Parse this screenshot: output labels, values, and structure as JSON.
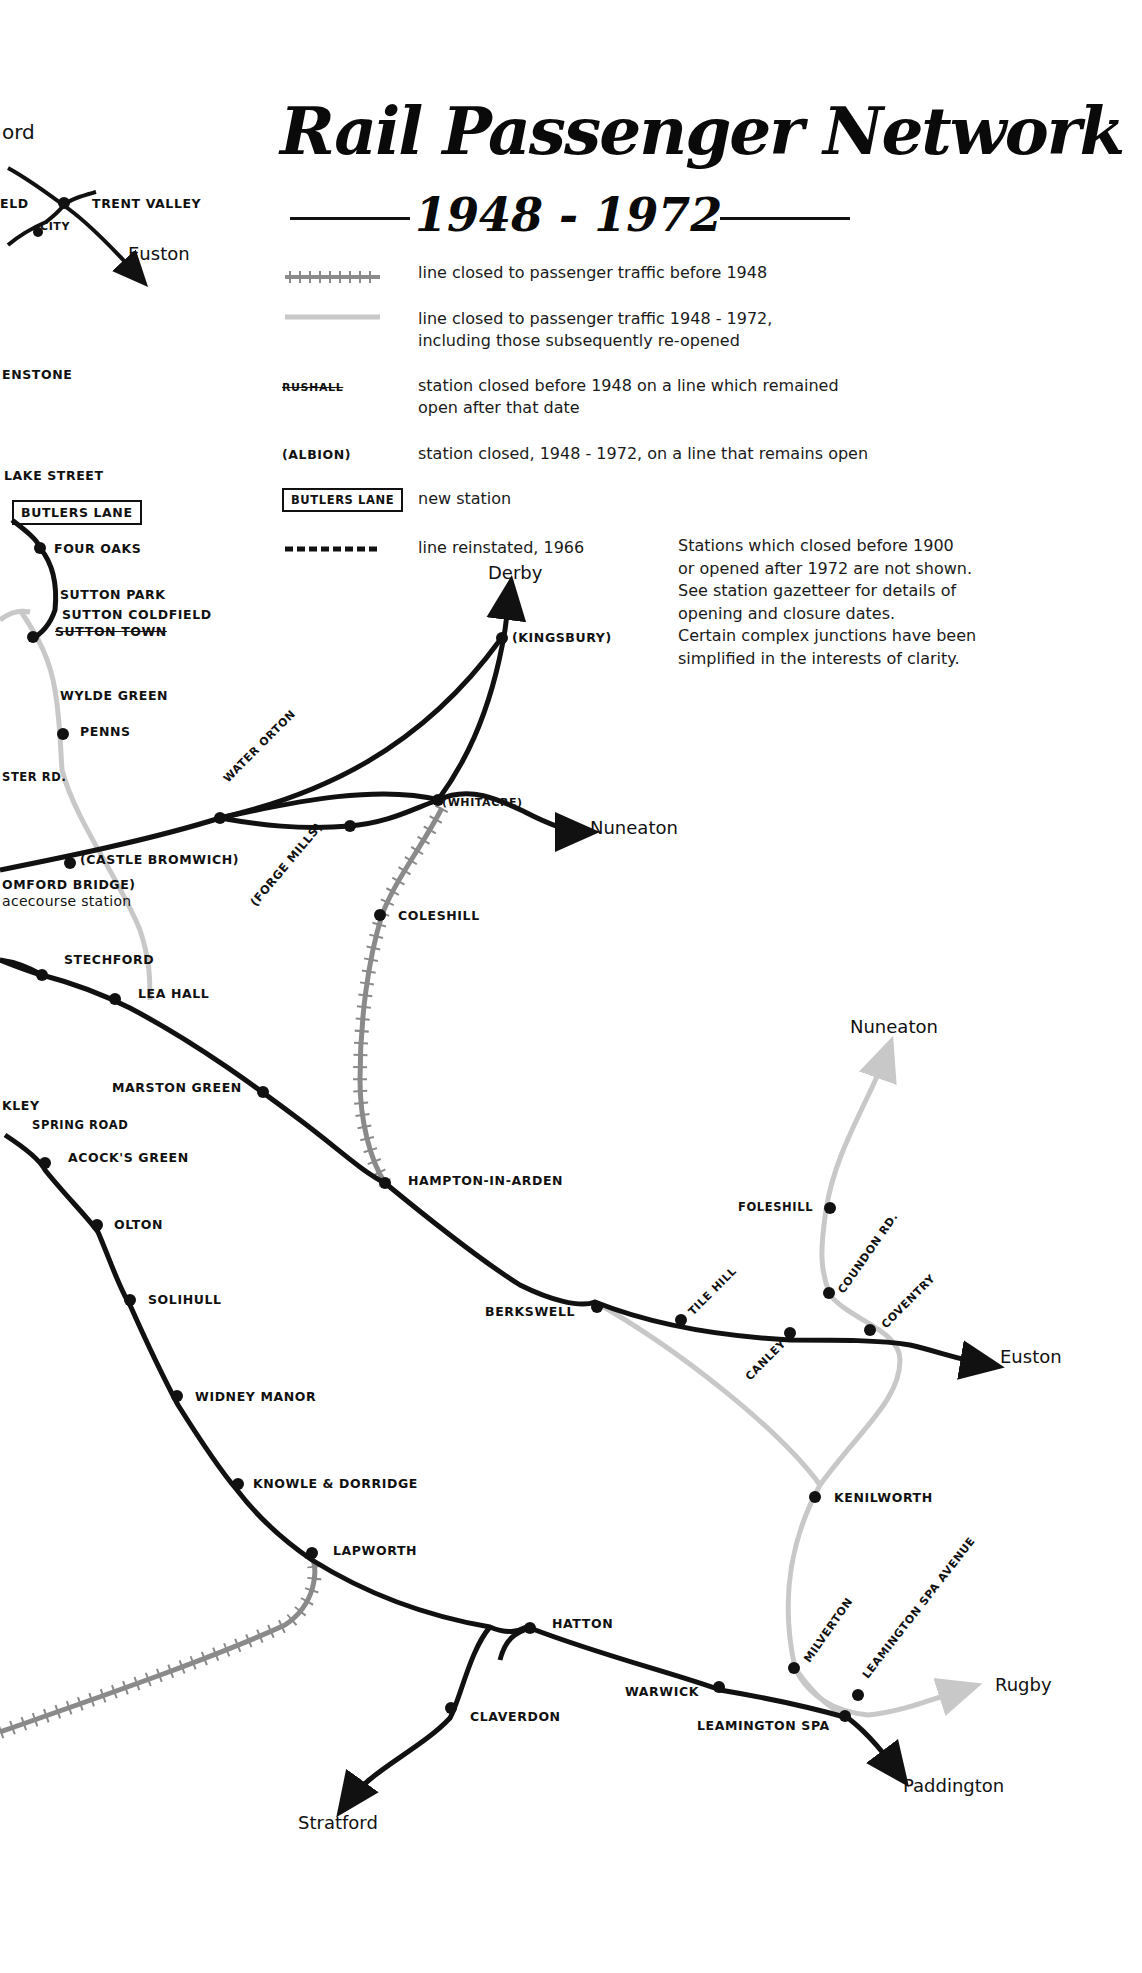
{
  "title": {
    "main": "Rail Passenger Network",
    "years": "1948 - 1972"
  },
  "legend": [
    {
      "symbol": "hatched-grey-line",
      "text": "line closed to passenger traffic before 1948"
    },
    {
      "symbol": "light-grey-line",
      "text": "line closed to passenger traffic 1948 - 1972,",
      "text2": "including those subsequently re-opened"
    },
    {
      "symbol": "struck-station",
      "sample": "RUSHALL",
      "text": "station closed before 1948 on a line which remained",
      "text2": "open after that date"
    },
    {
      "symbol": "bracketed-station",
      "sample": "(ALBION)",
      "text": "station closed, 1948 - 1972, on a line that remains open"
    },
    {
      "symbol": "boxed-station",
      "sample": "BUTLERS LANE",
      "text": "new station"
    },
    {
      "symbol": "dashed-line",
      "text": "line reinstated, 1966"
    }
  ],
  "notes": [
    "Stations which closed before 1900",
    "or opened after 1972 are not shown.",
    "See station gazetteer for details of",
    "opening and closure dates.",
    "Certain complex junctions have been",
    "simplified in the interests of clarity."
  ],
  "destinations": {
    "ord": "ord",
    "euston_top": "Euston",
    "derby": "Derby",
    "nuneaton_mid": "Nuneaton",
    "nuneaton_right": "Nuneaton",
    "euston_right": "Euston",
    "rugby": "Rugby",
    "paddington": "Paddington",
    "stratford": "Stratford"
  },
  "stations": {
    "eld": "ELD",
    "trent_valley": "TRENT VALLEY",
    "city": "CITY",
    "enstone": "ENSTONE",
    "lake_street": "LAKE STREET",
    "butlers_lane": "BUTLERS LANE",
    "four_oaks": "FOUR OAKS",
    "sutton_park": "SUTTON PARK",
    "sutton_coldfield": "SUTTON COLDFIELD",
    "sutton_town": "SUTTON TOWN",
    "wylde_green": "WYLDE GREEN",
    "penns": "PENNS",
    "ster_rd": "STER RD.",
    "water_orton": "WATER ORTON",
    "castle_bromwich": "(CASTLE BROMWICH)",
    "omford_bridge": "OMFORD BRIDGE)",
    "racecourse": "acecourse station",
    "forge_mills": "(FORGE MILLS)",
    "whitacre": "(WHITACRE)",
    "kingsbury": "(KINGSBURY)",
    "coleshill": "COLESHILL",
    "stechford": "STECHFORD",
    "lea_hall": "LEA HALL",
    "marston_green": "MARSTON GREEN",
    "kley": "KLEY",
    "spring_road": "SPRING ROAD",
    "acocks_green": "ACOCK'S GREEN",
    "olton": "OLTON",
    "solihull": "SOLIHULL",
    "widney_manor": "WIDNEY MANOR",
    "knowle_dorridge": "KNOWLE & DORRIDGE",
    "lapworth": "LAPWORTH",
    "hatton": "HATTON",
    "claverdon": "CLAVERDON",
    "warwick": "WARWICK",
    "leamington_spa": "LEAMINGTON SPA",
    "hampton_in_arden": "HAMPTON-IN-ARDEN",
    "berkswell": "BERKSWELL",
    "tile_hill": "TILE HILL",
    "canley": "CANLEY",
    "coventry": "COVENTRY",
    "foleshill": "FOLESHILL",
    "coundon_rd": "COUNDON RD.",
    "kenilworth": "KENILWORTH",
    "milverton": "MILVERTON",
    "leamington_spa_avenue": "LEAMINGTON SPA AVENUE"
  },
  "colors": {
    "open_line": "#111111",
    "closed_1948_1972": "#c8c8c8",
    "closed_before_1948": "#8a8a8a",
    "background": "#ffffff"
  }
}
